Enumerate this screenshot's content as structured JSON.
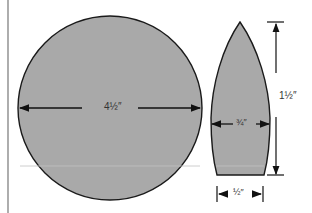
{
  "diagram": {
    "shapes": [
      {
        "name": "circle-pattern",
        "dimension_label": "4½″",
        "dimension": "diameter"
      },
      {
        "name": "bullet-pattern",
        "labels": {
          "height": "1½″",
          "width_middle": "¾″",
          "width_base": "½″"
        }
      }
    ],
    "colors": {
      "fill": "#a9a9a9",
      "stroke": "#1a1a1a",
      "background": "#ffffff"
    }
  }
}
